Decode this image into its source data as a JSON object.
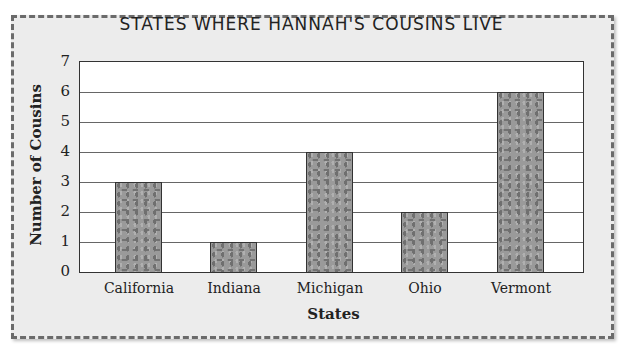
{
  "chart_data": {
    "type": "bar",
    "title": "STATES WHERE HANNAH'S COUSINS LIVE",
    "xlabel": "States",
    "ylabel": "Number of Cousins",
    "categories": [
      "California",
      "Indiana",
      "Michigan",
      "Ohio",
      "Vermont"
    ],
    "values": [
      3,
      1,
      4,
      2,
      6
    ],
    "ylim": [
      0,
      7
    ],
    "yticks": [
      "0",
      "1",
      "2",
      "3",
      "4",
      "5",
      "6",
      "7"
    ],
    "grid": true,
    "legend": null
  },
  "colors": {
    "bar_fill": "#9a9a9a",
    "frame_bg": "#ececec",
    "plot_bg": "#ffffff"
  }
}
